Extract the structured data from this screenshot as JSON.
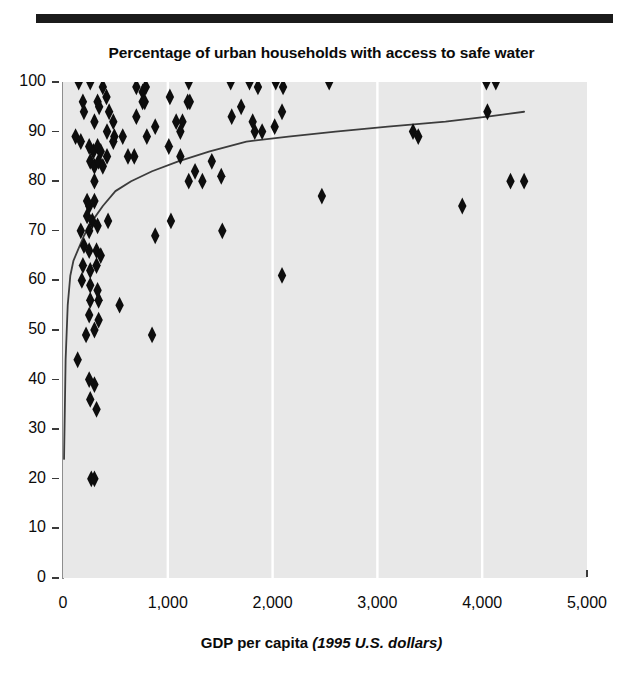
{
  "figure": {
    "title": "Percentage of urban households with access to safe water",
    "rule_bar_color": "#1b1b1b",
    "plot_bg_color": "#e8e8e8",
    "marker_color": "#0d0d0d",
    "trendline_color": "#3c3c3c",
    "gridline_color": "#ffffff"
  },
  "xaxis": {
    "title_bold": "GDP per capita",
    "title_italic": "(1995 U.S. dollars)",
    "ticks": [
      "0",
      "1,000",
      "2,000",
      "3,000",
      "4,000",
      "5,000"
    ]
  },
  "yaxis": {
    "ticks": [
      "100",
      "90",
      "80",
      "70",
      "60",
      "50",
      "40",
      "30",
      "20",
      "10",
      "0"
    ]
  },
  "chart_data": {
    "type": "scatter",
    "title": "Percentage of urban households with access to safe water",
    "xlabel": "GDP per capita (1995 U.S. dollars)",
    "ylabel": "Percentage of urban households with access to safe water",
    "xlim": [
      0,
      5000
    ],
    "ylim": [
      0,
      100
    ],
    "xticks": [
      0,
      1000,
      2000,
      3000,
      4000,
      5000
    ],
    "yticks": [
      0,
      10,
      20,
      30,
      40,
      50,
      60,
      70,
      80,
      90,
      100
    ],
    "grid": "vertical-white-gridlines-at-1000-2000-3000-4000",
    "legend": "none",
    "marker": "diamond",
    "points": [
      [
        150,
        100
      ],
      [
        260,
        100
      ],
      [
        380,
        99
      ],
      [
        415,
        97
      ],
      [
        700,
        99
      ],
      [
        760,
        98
      ],
      [
        790,
        99
      ],
      [
        1020,
        97
      ],
      [
        1200,
        100
      ],
      [
        1600,
        100
      ],
      [
        1780,
        100
      ],
      [
        1860,
        99
      ],
      [
        2030,
        100
      ],
      [
        2100,
        99
      ],
      [
        2540,
        100
      ],
      [
        4040,
        100
      ],
      [
        4130,
        100
      ],
      [
        190,
        96
      ],
      [
        200,
        94
      ],
      [
        330,
        96
      ],
      [
        345,
        95
      ],
      [
        440,
        94
      ],
      [
        760,
        96
      ],
      [
        780,
        96
      ],
      [
        1190,
        96
      ],
      [
        1210,
        96
      ],
      [
        1700,
        95
      ],
      [
        2090,
        94
      ],
      [
        300,
        92
      ],
      [
        480,
        92
      ],
      [
        700,
        93
      ],
      [
        880,
        91
      ],
      [
        1080,
        92
      ],
      [
        1140,
        92
      ],
      [
        1610,
        93
      ],
      [
        1810,
        92
      ],
      [
        2020,
        91
      ],
      [
        4050,
        94
      ],
      [
        120,
        89
      ],
      [
        170,
        88
      ],
      [
        420,
        90
      ],
      [
        490,
        89
      ],
      [
        570,
        89
      ],
      [
        800,
        89
      ],
      [
        1120,
        90
      ],
      [
        1830,
        90
      ],
      [
        1900,
        90
      ],
      [
        3340,
        90
      ],
      [
        3390,
        89
      ],
      [
        250,
        87
      ],
      [
        290,
        86
      ],
      [
        330,
        87
      ],
      [
        360,
        86
      ],
      [
        420,
        85
      ],
      [
        480,
        88
      ],
      [
        620,
        85
      ],
      [
        680,
        85
      ],
      [
        1010,
        87
      ],
      [
        1120,
        85
      ],
      [
        260,
        84
      ],
      [
        300,
        83
      ],
      [
        340,
        84
      ],
      [
        380,
        83
      ],
      [
        1260,
        82
      ],
      [
        1420,
        84
      ],
      [
        1510,
        81
      ],
      [
        300,
        80
      ],
      [
        1200,
        80
      ],
      [
        1330,
        80
      ],
      [
        4270,
        80
      ],
      [
        4400,
        80
      ],
      [
        230,
        76
      ],
      [
        250,
        75
      ],
      [
        300,
        76
      ],
      [
        2470,
        77
      ],
      [
        230,
        73
      ],
      [
        280,
        72
      ],
      [
        430,
        72
      ],
      [
        1030,
        72
      ],
      [
        3810,
        75
      ],
      [
        170,
        70
      ],
      [
        250,
        70
      ],
      [
        330,
        71
      ],
      [
        880,
        69
      ],
      [
        1520,
        70
      ],
      [
        200,
        67
      ],
      [
        250,
        66
      ],
      [
        320,
        66
      ],
      [
        360,
        65
      ],
      [
        190,
        63
      ],
      [
        260,
        62
      ],
      [
        320,
        63
      ],
      [
        2090,
        61
      ],
      [
        180,
        60
      ],
      [
        260,
        59
      ],
      [
        330,
        58
      ],
      [
        260,
        56
      ],
      [
        340,
        56
      ],
      [
        540,
        55
      ],
      [
        250,
        53
      ],
      [
        340,
        52
      ],
      [
        220,
        49
      ],
      [
        300,
        50
      ],
      [
        850,
        49
      ],
      [
        140,
        44
      ],
      [
        250,
        40
      ],
      [
        300,
        39
      ],
      [
        260,
        36
      ],
      [
        320,
        34
      ],
      [
        270,
        20
      ],
      [
        300,
        20
      ]
    ],
    "trendline": {
      "description": "Fitted logarithmic regression curve rising steeply from ~24% near GDP 0 to ~94% at GDP 4400",
      "points": [
        [
          10,
          24
        ],
        [
          25,
          44
        ],
        [
          45,
          55
        ],
        [
          70,
          61
        ],
        [
          100,
          64
        ],
        [
          140,
          66
        ],
        [
          200,
          69
        ],
        [
          280,
          72
        ],
        [
          380,
          75
        ],
        [
          500,
          78
        ],
        [
          650,
          80
        ],
        [
          850,
          82
        ],
        [
          1100,
          84
        ],
        [
          1400,
          86
        ],
        [
          1750,
          88
        ],
        [
          2150,
          89
        ],
        [
          2600,
          90
        ],
        [
          3100,
          91
        ],
        [
          3650,
          92
        ],
        [
          4050,
          93
        ],
        [
          4400,
          94
        ]
      ]
    }
  }
}
